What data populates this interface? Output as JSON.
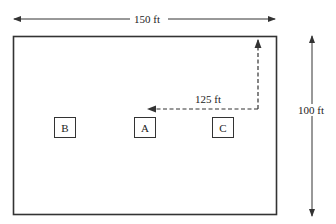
{
  "diagram": {
    "type": "floor-plan",
    "width_dimension": "150 ft",
    "height_dimension": "100 ft",
    "path_dimension": "125 ft",
    "locations": [
      {
        "id": "B",
        "label": "B"
      },
      {
        "id": "A",
        "label": "A"
      },
      {
        "id": "C",
        "label": "C"
      }
    ],
    "colors": {
      "line": "#333333",
      "background": "#ffffff"
    }
  }
}
